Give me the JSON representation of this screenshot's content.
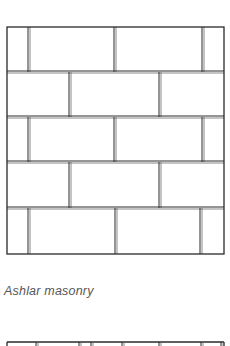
{
  "figure": {
    "caption": "Ashlar masonry",
    "stroke_color": "#2a2a2a",
    "joint_color": "#6a6a6a",
    "box": {
      "x": 7,
      "y": 27,
      "width": 217,
      "height": 227
    },
    "rows": [
      {
        "y0": 27,
        "y1": 72,
        "joints": [
          29,
          115,
          203
        ]
      },
      {
        "y0": 72,
        "y1": 117,
        "joints": [
          70,
          160
        ]
      },
      {
        "y0": 117,
        "y1": 162,
        "joints": [
          29,
          115,
          203
        ]
      },
      {
        "y0": 162,
        "y1": 208,
        "joints": [
          70,
          160
        ]
      },
      {
        "y0": 208,
        "y1": 254,
        "joints": [
          29,
          116,
          201
        ]
      }
    ]
  },
  "next_figure": {
    "top_y": 342,
    "x0": 7,
    "x1": 224,
    "joints": [
      37,
      80,
      92,
      123,
      160,
      202,
      222
    ]
  }
}
